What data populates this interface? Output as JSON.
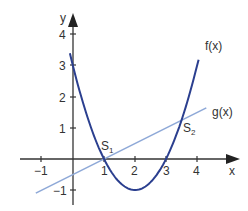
{
  "chart_data": {
    "type": "line",
    "title": "",
    "xlabel": "x",
    "ylabel": "y",
    "xlim": [
      -1.3,
      5.0
    ],
    "ylim": [
      -1.4,
      4.4
    ],
    "x_ticks": [
      "-1",
      "1",
      "2",
      "3",
      "4"
    ],
    "y_ticks": [
      "-1",
      "1",
      "2",
      "3",
      "4"
    ],
    "grid": false,
    "series": [
      {
        "name": "f(x)",
        "formula": "x^2 - 4x + 3",
        "color": "#2b3f8f",
        "x_range": [
          -0.1,
          4.05
        ]
      },
      {
        "name": "g(x)",
        "formula": "0.5x - 0.5",
        "color": "#8fa9d8",
        "x_range": [
          -1.2,
          4.3
        ]
      }
    ],
    "annotations": [
      {
        "label": "S1",
        "x": 1,
        "y": 0
      },
      {
        "label": "S2",
        "x": 3.5,
        "y": 1.25
      }
    ]
  },
  "labels": {
    "x_axis": "x",
    "y_axis": "y",
    "f": "f(x)",
    "g": "g(x)",
    "s1_main": "S",
    "s1_sub": "1",
    "s2_main": "S",
    "s2_sub": "2",
    "tick_x_m1": "−1",
    "tick_x_1": "1",
    "tick_x_2": "2",
    "tick_x_3": "3",
    "tick_x_4": "4",
    "tick_y_m1": "−1",
    "tick_y_1": "1",
    "tick_y_2": "2",
    "tick_y_3": "3",
    "tick_y_4": "4"
  }
}
